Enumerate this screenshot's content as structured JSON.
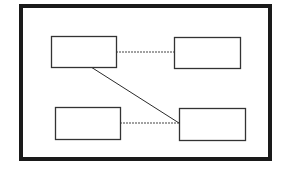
{
  "diagram": {
    "type": "block-diagram",
    "background": "#ffffff",
    "stroke_color": "#1a1a1a",
    "frame": {
      "x": 21,
      "y": 6,
      "width": 249,
      "height": 153,
      "stroke_width": 4
    },
    "nodes": [
      {
        "id": "node-top-left",
        "label": "",
        "x": 51,
        "y": 36,
        "width": 65,
        "height": 31
      },
      {
        "id": "node-top-right",
        "label": "",
        "x": 174,
        "y": 37,
        "width": 66,
        "height": 31
      },
      {
        "id": "node-bottom-left",
        "label": "",
        "x": 55,
        "y": 107,
        "width": 65,
        "height": 32
      },
      {
        "id": "node-bottom-right",
        "label": "",
        "x": 179,
        "y": 108,
        "width": 66,
        "height": 32
      }
    ],
    "edges": [
      {
        "id": "edge-top-horizontal",
        "from": "node-top-left",
        "to": "node-top-right",
        "style": "dotted",
        "x1": 116,
        "y1": 52,
        "x2": 174,
        "y2": 52
      },
      {
        "id": "edge-diagonal",
        "from": "node-top-left",
        "to": "node-bottom-right",
        "style": "solid",
        "x1": 91,
        "y1": 67,
        "x2": 179,
        "y2": 123
      },
      {
        "id": "edge-bottom-horizontal",
        "from": "node-bottom-left",
        "to": "node-bottom-right",
        "style": "dotted",
        "x1": 120,
        "y1": 123,
        "x2": 179,
        "y2": 123
      }
    ]
  }
}
